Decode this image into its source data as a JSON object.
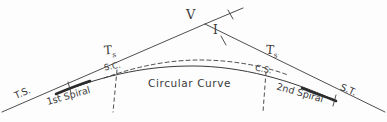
{
  "figure": {
    "kind": "spiral-curve-transition-diagram",
    "background_color": "#fdfdfd",
    "ink_color": "#3a3a3a"
  },
  "labels": {
    "vertex": "V",
    "intersection_angle": "I",
    "tangent_left": "T",
    "tangent_left_sub": "s",
    "tangent_right": "T",
    "tangent_right_sub": "s",
    "ts_point": "T.S.",
    "st_point": "S.T.",
    "sc_point": "S.C.",
    "cs_point": "C.S.",
    "first_spiral": "1st Spiral",
    "second_spiral": "2nd Spiral",
    "circular_curve": "Circular Curve"
  },
  "geometry": {
    "back_tangent": {
      "x1": 2,
      "y1": 112,
      "x2": 205,
      "y2": 24
    },
    "forward_tangent": {
      "x1": 205,
      "y1": 24,
      "x2": 385,
      "y2": 112
    },
    "tangent_extension": {
      "x1": 205,
      "y1": 24,
      "x2": 243,
      "y2": 8
    },
    "ts_tick": {
      "x": 68,
      "y": 84
    },
    "st_tick": {
      "x": 330,
      "y": 96
    },
    "sc_dashed_vertical": {
      "x": 116,
      "y1": 72,
      "y2": 110
    },
    "cs_dashed_vertical": {
      "x": 265,
      "y1": 73,
      "y2": 110
    },
    "solid_curve_path": "M 62 91 C 110 73 150 66 193 66 C 240 66 290 78 332 98",
    "dashed_arc_path": "M 106 77 C 140 65 172 60 200 60 C 232 60 262 65 286 74",
    "spiral_left_bold": {
      "x1": 56,
      "y1": 94,
      "x2": 88,
      "y2": 81
    },
    "spiral_right_bold": {
      "x1": 300,
      "y1": 88,
      "x2": 336,
      "y2": 101
    },
    "angle_tick_upper": {
      "x1": 228,
      "y1": 11,
      "x2": 233,
      "y2": 18
    },
    "angle_tick_lower": {
      "x1": 222,
      "y1": 37,
      "x2": 227,
      "y2": 44
    }
  }
}
